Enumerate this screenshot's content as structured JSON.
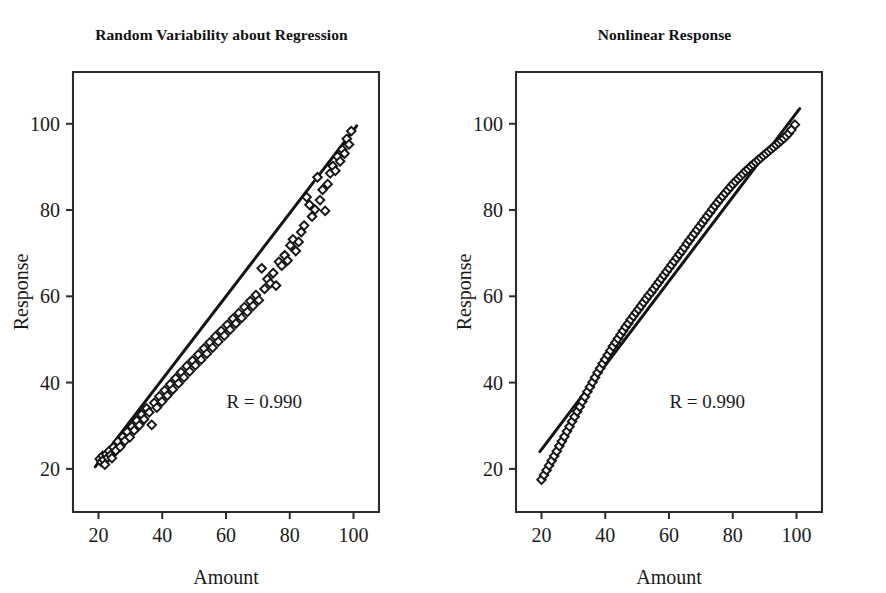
{
  "figure": {
    "background_color": "#ffffff",
    "ink_color": "#141414",
    "width": 886,
    "height": 593
  },
  "chart_data": [
    {
      "type": "scatter",
      "panel": "left",
      "title": "Random Variability about Regression",
      "xlabel": "Amount",
      "ylabel": "Response",
      "xlim": [
        12,
        108
      ],
      "ylim": [
        10,
        112
      ],
      "xticks": [
        20,
        40,
        60,
        80,
        100
      ],
      "yticks": [
        20,
        40,
        60,
        80,
        100
      ],
      "xtick_labels": [
        "20",
        "40",
        "60",
        "80",
        "100"
      ],
      "ytick_labels": [
        "20",
        "40",
        "60",
        "80",
        "100"
      ],
      "grid": false,
      "legend": "none",
      "marker": "open-diamond",
      "annotations": [
        {
          "text": "R = 0.990",
          "x": 72,
          "y": 34
        }
      ],
      "fit_line": {
        "type": "linear",
        "x": [
          19,
          101
        ],
        "y": [
          20.5,
          99.5
        ]
      },
      "x": [
        20.4,
        20.9,
        21.3,
        21.6,
        22.0,
        22.4,
        22.9,
        23.3,
        23.8,
        24.2,
        24.7,
        25.4,
        26.1,
        26.8,
        27.6,
        28.3,
        29.0,
        29.8,
        30.5,
        31.2,
        32.0,
        32.8,
        33.5,
        34.3,
        35.1,
        35.9,
        36.7,
        37.5,
        38.3,
        39.1,
        39.9,
        40.8,
        41.6,
        42.5,
        43.3,
        44.2,
        45.1,
        45.9,
        46.8,
        47.7,
        48.6,
        49.5,
        50.4,
        51.3,
        52.2,
        53.1,
        54.0,
        54.9,
        55.8,
        56.7,
        57.6,
        58.5,
        59.5,
        60.4,
        61.3,
        62.2,
        63.1,
        64.0,
        64.9,
        65.8,
        66.7,
        67.6,
        68.5,
        69.4,
        70.3,
        71.2,
        72.1,
        73.0,
        73.9,
        74.8,
        75.7,
        76.6,
        77.5,
        78.4,
        79.3,
        80.2,
        81.0,
        81.9,
        82.8,
        83.6,
        84.5,
        85.3,
        86.2,
        87.0,
        87.9,
        88.7,
        89.5,
        90.3,
        91.1,
        91.9,
        92.7,
        93.5,
        94.3,
        95.0,
        95.8,
        96.5,
        97.2,
        97.9,
        98.6,
        99.3
      ],
      "y": [
        22.3,
        21.6,
        23.0,
        22.1,
        21.0,
        23.4,
        22.6,
        24.1,
        23.2,
        22.5,
        25.0,
        24.2,
        26.3,
        25.1,
        27.4,
        26.5,
        28.6,
        27.3,
        29.8,
        28.9,
        31.2,
        30.1,
        32.6,
        31.5,
        34.0,
        33.1,
        30.2,
        35.3,
        34.2,
        36.8,
        35.6,
        38.2,
        37.0,
        39.6,
        38.4,
        41.0,
        39.8,
        42.4,
        41.2,
        43.8,
        42.6,
        45.1,
        44.0,
        46.5,
        45.3,
        47.9,
        46.7,
        49.3,
        48.1,
        50.7,
        49.5,
        52.0,
        50.9,
        53.4,
        52.3,
        54.8,
        53.7,
        56.1,
        55.0,
        57.5,
        56.4,
        58.9,
        57.8,
        60.3,
        59.1,
        66.5,
        61.7,
        64.0,
        63.0,
        65.4,
        62.5,
        68.0,
        67.1,
        69.5,
        68.3,
        71.8,
        73.2,
        70.5,
        72.6,
        74.9,
        76.4,
        83.0,
        81.2,
        78.5,
        80.1,
        87.6,
        82.3,
        84.7,
        79.8,
        86.0,
        88.5,
        90.2,
        89.1,
        92.4,
        91.3,
        94.0,
        93.1,
        96.5,
        95.2,
        98.3
      ]
    },
    {
      "type": "scatter",
      "panel": "right",
      "title": "Nonlinear Response",
      "xlabel": "Amount",
      "ylabel": "Response",
      "xlim": [
        12,
        108
      ],
      "ylim": [
        10,
        112
      ],
      "xticks": [
        20,
        40,
        60,
        80,
        100
      ],
      "yticks": [
        20,
        40,
        60,
        80,
        100
      ],
      "xtick_labels": [
        "20",
        "40",
        "60",
        "80",
        "100"
      ],
      "ytick_labels": [
        "20",
        "40",
        "60",
        "80",
        "100"
      ],
      "grid": false,
      "legend": "none",
      "marker": "open-diamond",
      "annotations": [
        {
          "text": "R = 0.990",
          "x": 72,
          "y": 34
        }
      ],
      "fit_line": {
        "type": "linear",
        "x": [
          19.5,
          101
        ],
        "y": [
          24.0,
          103.5
        ]
      },
      "x": [
        20.0,
        20.8,
        21.6,
        22.4,
        23.2,
        24.0,
        24.8,
        25.6,
        26.4,
        27.2,
        28.0,
        28.8,
        29.6,
        30.4,
        31.2,
        32.0,
        32.8,
        33.6,
        34.4,
        35.2,
        36.0,
        36.8,
        37.6,
        38.4,
        39.2,
        40.0,
        40.8,
        41.6,
        42.4,
        43.2,
        44.0,
        44.8,
        45.6,
        46.4,
        47.2,
        48.0,
        48.8,
        49.6,
        50.4,
        51.2,
        52.0,
        52.8,
        53.6,
        54.4,
        55.2,
        56.0,
        56.8,
        57.6,
        58.4,
        59.2,
        60.0,
        60.8,
        61.6,
        62.4,
        63.2,
        64.0,
        64.8,
        65.6,
        66.4,
        67.2,
        68.0,
        68.8,
        69.6,
        70.4,
        71.2,
        72.0,
        72.8,
        73.6,
        74.4,
        75.2,
        76.0,
        76.8,
        77.6,
        78.4,
        79.2,
        80.0,
        80.8,
        81.6,
        82.4,
        83.2,
        84.0,
        84.8,
        85.6,
        86.4,
        87.2,
        88.0,
        88.8,
        89.6,
        90.4,
        91.2,
        92.0,
        92.8,
        93.6,
        94.4,
        95.2,
        96.0,
        96.8,
        97.6,
        98.4,
        99.5
      ],
      "y": [
        17.5,
        18.6,
        19.7,
        20.8,
        21.9,
        23.0,
        24.1,
        25.3,
        26.4,
        27.5,
        28.7,
        29.8,
        31.0,
        32.1,
        33.3,
        34.4,
        35.6,
        36.7,
        37.9,
        39.0,
        40.1,
        41.2,
        42.3,
        43.3,
        44.4,
        45.4,
        46.4,
        47.4,
        48.4,
        49.3,
        50.2,
        51.1,
        52.0,
        52.9,
        53.7,
        54.6,
        55.4,
        56.2,
        57.0,
        57.8,
        58.6,
        59.4,
        60.2,
        60.9,
        61.7,
        62.5,
        63.3,
        64.1,
        64.9,
        65.7,
        66.5,
        67.3,
        68.1,
        68.9,
        69.7,
        70.5,
        71.3,
        72.2,
        73.0,
        73.8,
        74.6,
        75.4,
        76.2,
        77.0,
        77.8,
        78.6,
        79.4,
        80.2,
        81.0,
        81.7,
        82.5,
        83.2,
        83.9,
        84.6,
        85.3,
        86.0,
        86.6,
        87.2,
        87.8,
        88.4,
        89.0,
        89.5,
        90.1,
        90.6,
        91.1,
        91.6,
        92.1,
        92.6,
        93.1,
        93.6,
        94.1,
        94.6,
        95.1,
        95.6,
        96.1,
        96.6,
        97.2,
        97.8,
        98.6,
        99.8
      ]
    }
  ]
}
